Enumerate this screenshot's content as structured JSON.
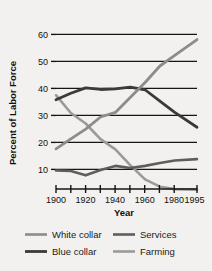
{
  "chart_data": {
    "type": "line",
    "title": "",
    "xlabel": "Year",
    "ylabel": "Percent of Labor Force",
    "xlim": [
      1900,
      1995
    ],
    "ylim": [
      0,
      62
    ],
    "xticks": [
      1900,
      1910,
      1920,
      1930,
      1940,
      1950,
      1960,
      1970,
      1980,
      1995
    ],
    "xtick_labels": [
      "1900",
      "",
      "1920",
      "",
      "1940",
      "",
      "1960",
      "",
      "1980",
      "1995"
    ],
    "yticks": [
      10,
      20,
      30,
      40,
      50,
      60
    ],
    "ytick_labels": [
      "10",
      "20",
      "30",
      "40",
      "50",
      "60"
    ],
    "grid": "horizontal",
    "legend_position": "bottom",
    "series": [
      {
        "name": "White collar",
        "color": "#8c8c8c",
        "x": [
          1900,
          1910,
          1920,
          1930,
          1940,
          1950,
          1960,
          1970,
          1980,
          1995
        ],
        "values": [
          17.6,
          21.3,
          24.9,
          29.4,
          31.1,
          36.6,
          42.2,
          48.3,
          52.2,
          58.1
        ]
      },
      {
        "name": "Blue collar",
        "color": "#3a3a3a",
        "x": [
          1900,
          1910,
          1920,
          1930,
          1940,
          1950,
          1960,
          1970,
          1980,
          1995
        ],
        "values": [
          35.8,
          38.2,
          40.2,
          39.6,
          39.8,
          40.5,
          39.5,
          35.3,
          31.1,
          25.6
        ]
      },
      {
        "name": "Services",
        "color": "#5e5e5e",
        "x": [
          1900,
          1910,
          1920,
          1930,
          1940,
          1950,
          1960,
          1970,
          1980,
          1995
        ],
        "values": [
          9.6,
          9.4,
          7.8,
          9.8,
          11.3,
          10.5,
          11.3,
          12.4,
          13.3,
          13.8
        ]
      },
      {
        "name": "Farming",
        "color": "#9a9a9a",
        "x": [
          1900,
          1910,
          1920,
          1930,
          1940,
          1950,
          1960,
          1970,
          1980,
          1995
        ],
        "values": [
          37.5,
          30.9,
          27.0,
          21.2,
          17.4,
          11.6,
          6.3,
          3.6,
          2.7,
          2.5
        ]
      }
    ]
  },
  "axes": {
    "ylabel": "Percent of Labor Force",
    "xlabel": "Year"
  },
  "ticks": {
    "y": [
      "60",
      "50",
      "40",
      "30",
      "20",
      "10"
    ],
    "x": [
      "1900",
      "1920",
      "1940",
      "1960",
      "1980",
      "1995"
    ]
  },
  "legend": {
    "entries": [
      {
        "label": "White collar",
        "color": "#8c8c8c"
      },
      {
        "label": "Services",
        "color": "#5e5e5e"
      },
      {
        "label": "Blue collar",
        "color": "#3a3a3a"
      },
      {
        "label": "Farming",
        "color": "#9a9a9a"
      }
    ]
  }
}
